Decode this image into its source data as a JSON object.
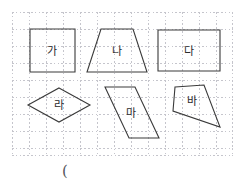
{
  "page": {
    "width": 241,
    "height": 188,
    "background_color": "#ffffff"
  },
  "grid": {
    "name": "dotted-graph-grid",
    "x": 12,
    "y": 12,
    "width": 221,
    "height": 144,
    "cell_size": 17,
    "line_color": "#c5c5cc",
    "line_style": "dotted"
  },
  "shapes": [
    {
      "id": "shape-ga",
      "label": "가",
      "type": "square",
      "points": "30,29 75,29 75,72 30,72",
      "label_x": 52,
      "label_y": 51
    },
    {
      "id": "shape-na",
      "label": "나",
      "type": "trapezoid",
      "points": "101,29 133,29 147,72 87,72",
      "label_x": 117,
      "label_y": 51
    },
    {
      "id": "shape-da",
      "label": "다",
      "type": "rectangle",
      "points": "158,30 220,30 220,71 158,71",
      "label_x": 189,
      "label_y": 51
    },
    {
      "id": "shape-ra",
      "label": "라",
      "type": "rhombus",
      "points": "59,88 90,105 59,122 28,105",
      "label_x": 59,
      "label_y": 105
    },
    {
      "id": "shape-ma",
      "label": "마",
      "type": "parallelogram",
      "points": "105,87 135,87 159,138 129,138",
      "label_x": 131,
      "label_y": 113
    },
    {
      "id": "shape-ba",
      "label": "바",
      "type": "quadrilateral",
      "points": "175,87 204,85 220,127 173,111",
      "label_x": 192,
      "label_y": 101
    }
  ],
  "shape_outline_color": "#3a3a3a",
  "answer": {
    "text": "(",
    "x": 62,
    "y": 162
  }
}
